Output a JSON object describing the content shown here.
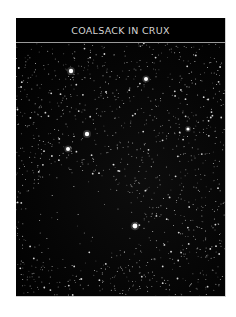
{
  "plate": {
    "title": "COALSACK IN CRUX",
    "background_color": "#000000",
    "title_color": "#d4d4d4",
    "divider_color": "#9a9a9a"
  },
  "star_field": {
    "description": "Dense field of faint white stars with a dark nebula region (Coalsack) toward lower-left",
    "bright_stars": [
      {
        "x": 55,
        "y": 28,
        "r": 2.2
      },
      {
        "x": 130,
        "y": 36,
        "r": 2.0
      },
      {
        "x": 71,
        "y": 91,
        "r": 2.2
      },
      {
        "x": 52,
        "y": 106,
        "r": 2.0
      },
      {
        "x": 172,
        "y": 86,
        "r": 1.6
      },
      {
        "x": 119,
        "y": 183,
        "r": 2.4
      }
    ]
  }
}
